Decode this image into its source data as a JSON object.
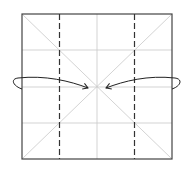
{
  "diagram": {
    "type": "origami-fold-instruction",
    "paper": {
      "x": 22,
      "y": 14,
      "width": 150,
      "height": 145,
      "stroke": "#444444"
    },
    "colors": {
      "crease": "#c8c8c8",
      "outline": "#444444",
      "valley_fold": "#333333",
      "arrow": "#222222",
      "background": "#ffffff"
    },
    "grid_lines": {
      "vertical_x": [
        97
      ],
      "horizontal_y": [
        50,
        87,
        123
      ]
    },
    "diagonals": true,
    "valley_folds": [
      {
        "x": 59
      },
      {
        "x": 134
      }
    ],
    "arrows": [
      {
        "name": "left-flap-to-center",
        "from": "left-edge",
        "to": "center"
      },
      {
        "name": "right-flap-to-center",
        "from": "right-edge",
        "to": "center"
      }
    ]
  }
}
